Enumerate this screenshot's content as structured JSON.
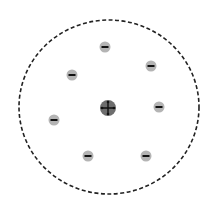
{
  "diagram": {
    "title": "",
    "boundary": {
      "style": "dashed",
      "color": "#222222"
    },
    "nucleus": {
      "charge": "positive",
      "symbol": "+",
      "fill": "#6e6e6e",
      "mark_color": "#111111"
    },
    "electrons": [
      {
        "id": "e1",
        "charge": "negative",
        "symbol": "-"
      },
      {
        "id": "e2",
        "charge": "negative",
        "symbol": "-"
      },
      {
        "id": "e3",
        "charge": "negative",
        "symbol": "-"
      },
      {
        "id": "e4",
        "charge": "negative",
        "symbol": "-"
      },
      {
        "id": "e5",
        "charge": "negative",
        "symbol": "-"
      },
      {
        "id": "e6",
        "charge": "negative",
        "symbol": "-"
      },
      {
        "id": "e7",
        "charge": "negative",
        "symbol": "-"
      }
    ],
    "electron_fill": "#b4b4b4",
    "electron_mark_color": "#111111"
  }
}
